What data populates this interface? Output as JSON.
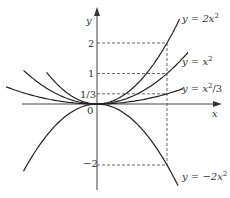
{
  "chart_data": {
    "type": "line",
    "title": "",
    "xlabel": "x",
    "ylabel": "y",
    "x_dashed_at": 1,
    "y_ticks": [
      {
        "value": 2,
        "label": "2"
      },
      {
        "value": 1,
        "label": "1"
      },
      {
        "value": 0.3333,
        "label": "1/3"
      },
      {
        "value": -2,
        "label": "−2"
      }
    ],
    "origin_label": "0",
    "series": [
      {
        "name": "y = 2x^2",
        "formula": "2*x*x",
        "label_main": "y = 2x",
        "label_sup": "2"
      },
      {
        "name": "y = x^2",
        "formula": "x*x",
        "label_main": "y = x",
        "label_sup": "2"
      },
      {
        "name": "y = x^2/3",
        "formula": "x*x/3",
        "label_main": "y = x",
        "label_sup": "2",
        "label_tail": "/3"
      },
      {
        "name": "y = -2x^2",
        "formula": "-2*x*x",
        "label_main": "y = −2x",
        "label_sup": "2"
      }
    ],
    "xlim": [
      -1.4,
      1.4
    ],
    "ylim": [
      -2.5,
      2.5
    ],
    "grid": false
  }
}
